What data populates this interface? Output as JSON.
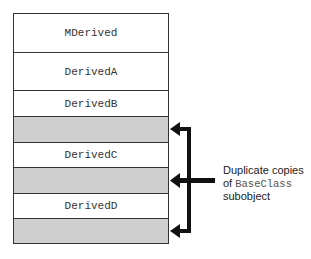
{
  "diagram": {
    "type": "memory-layout",
    "rows": [
      {
        "label": "MDerived",
        "shaded": false
      },
      {
        "label": "DerivedA",
        "shaded": false
      },
      {
        "label": "DerivedB",
        "shaded": false
      },
      {
        "label": "",
        "shaded": true
      },
      {
        "label": "DerivedC",
        "shaded": false
      },
      {
        "label": "",
        "shaded": true
      },
      {
        "label": "DerivedD",
        "shaded": false
      },
      {
        "label": "",
        "shaded": true
      }
    ],
    "annotation": {
      "line1": "Duplicate copies",
      "line2_prefix": "of ",
      "line2_code": "BaseClass",
      "line3": "subobject"
    },
    "colors": {
      "shaded": "#cfcfcf",
      "border": "#333333",
      "arrow": "#111111"
    }
  }
}
